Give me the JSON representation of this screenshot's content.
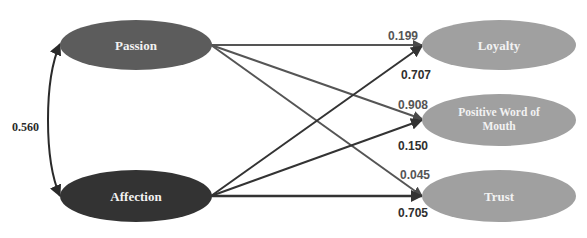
{
  "diagram": {
    "title_cut_off": "",
    "colors": {
      "passion": "#5c5c5c",
      "affection": "#333333",
      "outcome": "#a0a0a0",
      "passion_path": "#555555",
      "affection_path": "#333333"
    },
    "nodes": {
      "passion": {
        "label": "Passion"
      },
      "affection": {
        "label": "Affection"
      },
      "loyalty": {
        "label": "Loyalty"
      },
      "pwom": {
        "label_line1": "Positive Word of",
        "label_line2": "Mouth"
      },
      "trust": {
        "label": "Trust"
      }
    },
    "correlation": {
      "from": "Passion",
      "to": "Affection",
      "value": "0.560"
    },
    "paths": [
      {
        "from": "Passion",
        "to": "Loyalty",
        "value": "0.199"
      },
      {
        "from": "Affection",
        "to": "Loyalty",
        "value": "0.707"
      },
      {
        "from": "Passion",
        "to": "Positive Word of Mouth",
        "value": "0.908"
      },
      {
        "from": "Affection",
        "to": "Positive Word of Mouth",
        "value": "0.150"
      },
      {
        "from": "Passion",
        "to": "Trust",
        "value": "0.045"
      },
      {
        "from": "Affection",
        "to": "Trust",
        "value": "0.705"
      }
    ]
  }
}
